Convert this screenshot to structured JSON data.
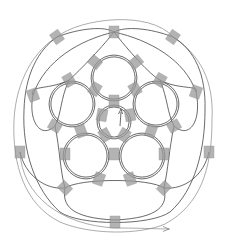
{
  "diagram": {
    "type": "knot-diagram",
    "colors": {
      "background": "#ffffff",
      "strand": "#444444",
      "outer_strand": "#888888",
      "tile": "#9a9a9a"
    },
    "center": [
      114,
      118
    ],
    "rings": [
      {
        "name": "top",
        "cx": 114,
        "cy": 78,
        "r": 22
      },
      {
        "name": "upper-right",
        "cx": 156,
        "cy": 104,
        "r": 22
      },
      {
        "name": "lower-right",
        "cx": 142,
        "cy": 156,
        "r": 22
      },
      {
        "name": "lower-left",
        "cx": 86,
        "cy": 156,
        "r": 22
      },
      {
        "name": "upper-left",
        "cx": 72,
        "cy": 104,
        "r": 22
      },
      {
        "name": "inner",
        "cx": 114,
        "cy": 122,
        "r": 16
      }
    ],
    "tiles": [
      {
        "x": 114,
        "y": 32,
        "angle": 0
      },
      {
        "x": 57,
        "y": 37,
        "angle": -35
      },
      {
        "x": 173,
        "y": 37,
        "angle": 35
      },
      {
        "x": 95,
        "y": 62,
        "angle": -50
      },
      {
        "x": 136,
        "y": 62,
        "angle": 50
      },
      {
        "x": 69,
        "y": 80,
        "angle": -30
      },
      {
        "x": 160,
        "y": 80,
        "angle": 30
      },
      {
        "x": 33,
        "y": 95,
        "angle": -20
      },
      {
        "x": 196,
        "y": 92,
        "angle": 20
      },
      {
        "x": 95,
        "y": 89,
        "angle": 30
      },
      {
        "x": 135,
        "y": 89,
        "angle": -30
      },
      {
        "x": 114,
        "y": 101,
        "angle": 0
      },
      {
        "x": 102,
        "y": 115,
        "angle": 10
      },
      {
        "x": 130,
        "y": 115,
        "angle": -10
      },
      {
        "x": 55,
        "y": 126,
        "angle": -60
      },
      {
        "x": 174,
        "y": 126,
        "angle": 60
      },
      {
        "x": 81,
        "y": 131,
        "angle": -20
      },
      {
        "x": 151,
        "y": 131,
        "angle": 20
      },
      {
        "x": 105,
        "y": 135,
        "angle": -30
      },
      {
        "x": 124,
        "y": 135,
        "angle": 30
      },
      {
        "x": 20,
        "y": 152,
        "angle": 0
      },
      {
        "x": 65,
        "y": 154,
        "angle": 0
      },
      {
        "x": 114,
        "y": 154,
        "angle": 0
      },
      {
        "x": 164,
        "y": 154,
        "angle": 0
      },
      {
        "x": 209,
        "y": 152,
        "angle": 0
      },
      {
        "x": 99,
        "y": 179,
        "angle": 20
      },
      {
        "x": 130,
        "y": 179,
        "angle": -20
      },
      {
        "x": 65,
        "y": 188,
        "angle": -45
      },
      {
        "x": 164,
        "y": 188,
        "angle": 45
      },
      {
        "x": 115,
        "y": 222,
        "angle": 0
      }
    ],
    "arrow": {
      "x": 120,
      "y": 119,
      "direction": "up"
    },
    "end_arrow": {
      "x": 168,
      "y": 229,
      "direction": "right"
    }
  }
}
